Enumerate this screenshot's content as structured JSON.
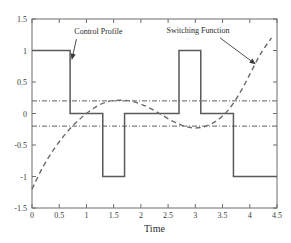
{
  "chart_data": {
    "type": "line",
    "title": "",
    "xlabel": "Time",
    "ylabel": "",
    "xlim": [
      0,
      4.5
    ],
    "ylim": [
      -1.5,
      1.5
    ],
    "grid": false,
    "legend": "none",
    "xticks": [
      "0",
      "0.5",
      "1",
      "1.5",
      "2",
      "2.5",
      "3",
      "3.5",
      "4",
      "4.5"
    ],
    "xtick_values": [
      0,
      0.5,
      1,
      1.5,
      2,
      2.5,
      3,
      3.5,
      4,
      4.5
    ],
    "yticks": [
      "-1.5",
      "-1",
      "-0.5",
      "0",
      "0.5",
      "1",
      "1.5"
    ],
    "ytick_values": [
      -1.5,
      -1,
      -0.5,
      0,
      0.5,
      1,
      1.5
    ],
    "series": [
      {
        "name": "Control Profile",
        "style": "solid",
        "type": "step",
        "x": [
          0,
          0.7,
          0.7,
          1.3,
          1.3,
          1.7,
          1.7,
          2.7,
          2.7,
          3.1,
          3.1,
          3.7,
          3.7,
          4.5
        ],
        "values": [
          1,
          1,
          0,
          0,
          -1,
          -1,
          0,
          0,
          1,
          1,
          0,
          0,
          -1,
          -1
        ]
      },
      {
        "name": "Switching Function",
        "style": "dashed",
        "type": "curve",
        "x": [
          0,
          0.2,
          0.4,
          0.6,
          0.8,
          1.0,
          1.2,
          1.4,
          1.6,
          1.8,
          2.0,
          2.2,
          2.4,
          2.6,
          2.8,
          3.0,
          3.2,
          3.4,
          3.6,
          3.8,
          4.0,
          4.2,
          4.4
        ],
        "values": [
          -1.2,
          -0.85,
          -0.57,
          -0.34,
          -0.15,
          0.0,
          0.12,
          0.19,
          0.21,
          0.2,
          0.15,
          0.07,
          -0.03,
          -0.13,
          -0.2,
          -0.23,
          -0.2,
          -0.11,
          0.05,
          0.3,
          0.62,
          0.95,
          1.2
        ]
      },
      {
        "name": "Upper Threshold",
        "style": "dash-dot",
        "type": "hline",
        "value": 0.2
      },
      {
        "name": "Lower Threshold",
        "style": "dash-dot",
        "type": "hline",
        "value": -0.2
      }
    ],
    "annotations": [
      {
        "text": "Control Profile",
        "text_x": 1.22,
        "text_y": 1.26,
        "arrow_to_x": 0.73,
        "arrow_to_y": 0.85
      },
      {
        "text": "Switching Function",
        "text_x": 3.05,
        "text_y": 1.28,
        "arrow_to_x": 4.11,
        "arrow_to_y": 0.78
      }
    ],
    "colors": {
      "control_profile": "#5a5a5a",
      "switching_function": "#6a6a6a",
      "threshold": "#5f5f5f",
      "axis": "#6d6d6d",
      "text": "#2b2b2b",
      "background": "#ffffff"
    }
  }
}
